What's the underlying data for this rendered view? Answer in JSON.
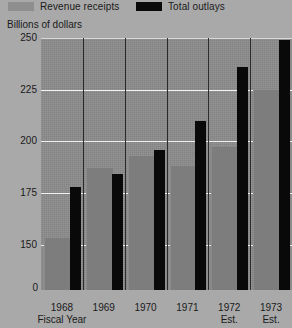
{
  "legend": {
    "items": [
      {
        "label": "Revenue receipts",
        "color": "#8e8e8e",
        "key": "revenue"
      },
      {
        "label": "Total outlays",
        "color": "#0a0a0a",
        "key": "outlays"
      }
    ]
  },
  "axis_title": "Billions of dollars",
  "zero_label": "0",
  "chart_data": {
    "type": "bar",
    "title": "",
    "subtitle": "",
    "xlabel": "Fiscal Year",
    "ylabel": "Billions of dollars",
    "categories": [
      "1968",
      "1969",
      "1970",
      "1971",
      "1972",
      "1973"
    ],
    "category_sublabels": [
      "Fiscal Year",
      "",
      "",
      "",
      "Est.",
      "Est."
    ],
    "series": [
      {
        "name": "Revenue receipts",
        "color": "#7d7d7d",
        "values": [
          153,
          187,
          193,
          188,
          197,
          225
        ]
      },
      {
        "name": "Total outlays",
        "color": "#090909",
        "values": [
          178,
          184,
          196,
          210,
          236,
          249
        ]
      }
    ],
    "ylim": [
      128,
      250
    ],
    "yticks": [
      250,
      225,
      200,
      175,
      150
    ],
    "ytick_labels": [
      "250",
      "225",
      "200",
      "175",
      "150"
    ],
    "grid": true,
    "grid_color": "#f2f2f2",
    "legend_position": "top",
    "plot_background": "#8c8c8c",
    "page_background": "#a9a9a9"
  }
}
